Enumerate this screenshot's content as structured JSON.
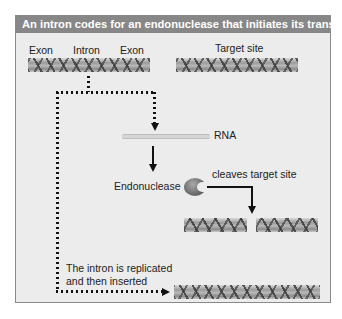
{
  "diagram": {
    "title": "An intron codes for an endonuclease that initiates its transfer",
    "colors": {
      "header_bg": "#878787",
      "header_text": "#ffffff",
      "panel_bg": "#ececec",
      "arrow": "#111111"
    },
    "source_gene": {
      "labels": [
        "Exon",
        "Intron",
        "Exon"
      ]
    },
    "target": {
      "label": "Target site"
    },
    "rna": {
      "label": "RNA"
    },
    "enzyme": {
      "label": "Endonuclease",
      "action_label": "cleaves target site"
    },
    "insertion": {
      "label_line1": "The intron is replicated",
      "label_line2": "and then inserted"
    }
  }
}
